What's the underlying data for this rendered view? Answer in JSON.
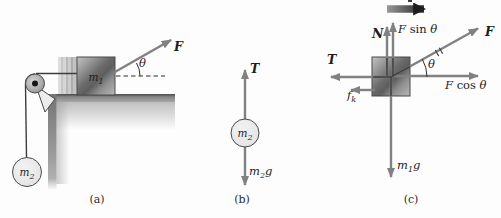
{
  "figure": {
    "captions": {
      "a": "(a)",
      "b": "(b)",
      "c": "(c)"
    }
  },
  "labels": {
    "m1": [
      {
        "t": "m",
        "s": "i"
      },
      {
        "t": "1",
        "s": "sub"
      }
    ],
    "m2": [
      {
        "t": "m",
        "s": "i"
      },
      {
        "t": "2",
        "s": "sub"
      }
    ],
    "m1g": [
      {
        "t": "m",
        "s": "i"
      },
      {
        "t": "1",
        "s": "sub"
      },
      {
        "t": "g",
        "s": "i"
      }
    ],
    "m2g": [
      {
        "t": "m",
        "s": "i"
      },
      {
        "t": "2",
        "s": "sub"
      },
      {
        "t": "g",
        "s": "i"
      }
    ],
    "F": [
      {
        "t": "F",
        "s": "b"
      }
    ],
    "T": [
      {
        "t": "T",
        "s": "b"
      }
    ],
    "N": [
      {
        "t": "N",
        "s": "b"
      }
    ],
    "theta": [
      {
        "t": "θ",
        "s": "i"
      }
    ],
    "F_sin_theta": [
      {
        "t": "F",
        "s": "i"
      },
      {
        "t": " sin ",
        "s": "n"
      },
      {
        "t": "θ",
        "s": "i"
      }
    ],
    "F_cos_theta": [
      {
        "t": "F",
        "s": "i"
      },
      {
        "t": " cos ",
        "s": "n"
      },
      {
        "t": "θ",
        "s": "i"
      }
    ],
    "f_k": [
      {
        "t": "f",
        "s": "i"
      },
      {
        "t": "k",
        "s": "sub"
      }
    ]
  },
  "icons": {
    "force-arrow": "gray tapered arrow with solid triangular head",
    "acceleration-arrow": "thick dark right-pointing arrow",
    "equal-vector-ticks": "double hash marks on F vector",
    "angle-arc": "small arc marking theta between F and horizontal"
  },
  "colors": {
    "arrow_gray": "#818181",
    "accel_dark": "#1f1f1f",
    "text": "#1c1c1c",
    "block_dark": "#5e5e5e",
    "table_gray": "#8a8a8a",
    "ball_fill": "#e9e9e9",
    "background": "#fdfdfd"
  }
}
